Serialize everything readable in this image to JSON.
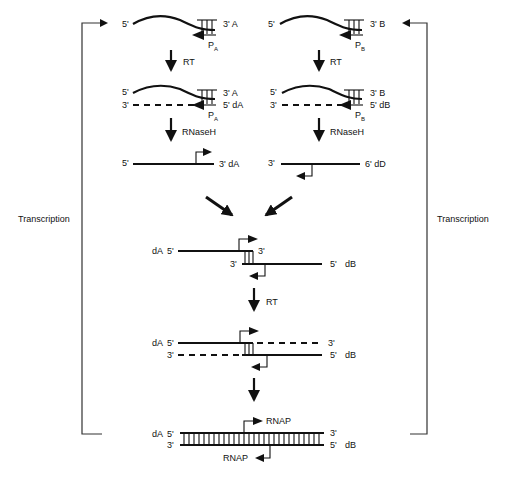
{
  "diagram": {
    "left_column": {
      "rna": {
        "five": "5'",
        "three": "3' A",
        "primer": "P",
        "primer_sub": "A"
      },
      "step1": "RT",
      "hybrid": {
        "top_five": "5'",
        "top_three": "3' A",
        "bottom_three": "3'",
        "bottom_five": "5' dA",
        "primer": "P",
        "primer_sub": "A"
      },
      "step2": "RNaseH",
      "single": {
        "left": "5'",
        "right": "3' dA"
      }
    },
    "right_column": {
      "rna": {
        "five": "5'",
        "three": "3' B",
        "primer": "P",
        "primer_sub": "B"
      },
      "step1": "RT",
      "hybrid": {
        "top_five": "5'",
        "top_three": "3' B",
        "bottom_three": "3'",
        "bottom_five": "5' dB",
        "primer": "P",
        "primer_sub": "B"
      },
      "step2": "RNaseH",
      "single": {
        "left": "3'",
        "right": "6' dD"
      }
    },
    "annealed": {
      "top_name": "dA",
      "top_five": "5'",
      "top_three": "3'",
      "bottom_three": "3'",
      "bottom_five": "5'",
      "bottom_name": "dB"
    },
    "extension_step": "RT",
    "extended": {
      "top_name": "dA",
      "top_five": "5'",
      "top_three": "3'",
      "bottom_three": "3'",
      "bottom_five": "5'",
      "bottom_name": "dB"
    },
    "final": {
      "top_name": "dA",
      "top_five": "5'",
      "top_three": "3'",
      "bottom_three": "3'",
      "bottom_five": "5'",
      "bottom_name": "dB",
      "rnap_top": "RNAP",
      "rnap_bottom": "RNAP"
    },
    "feedback_left": "Transcription",
    "feedback_right": "Transcription",
    "colors": {
      "ink": "#111111",
      "background": "#ffffff"
    }
  }
}
